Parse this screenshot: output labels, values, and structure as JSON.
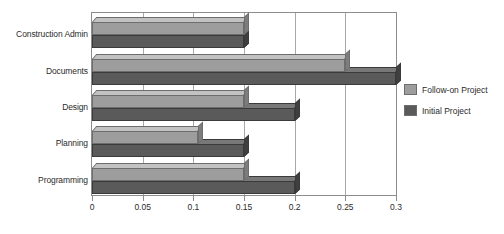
{
  "chart_data": {
    "type": "bar",
    "orientation": "horizontal",
    "title": "",
    "xlabel": "",
    "ylabel": "",
    "categories": [
      "Construction Admin",
      "Documents",
      "Design",
      "Planning",
      "Programming"
    ],
    "series": [
      {
        "name": "Follow-on Project",
        "color": "#9d9d9d",
        "values": [
          0.15,
          0.25,
          0.15,
          0.105,
          0.15
        ]
      },
      {
        "name": "Initial Project",
        "color": "#5a5a5a",
        "values": [
          0.15,
          0.3,
          0.2,
          0.15,
          0.2
        ]
      }
    ],
    "xlim": [
      0,
      0.3
    ],
    "xticks": [
      0,
      0.05,
      0.1,
      0.15,
      0.2,
      0.25,
      0.3
    ],
    "xtick_labels": [
      "0",
      "0.05",
      "0.1",
      "0.15",
      "0.2",
      "0.25",
      "0.3"
    ],
    "grid": true,
    "grid_axis": "x",
    "legend_position": "right",
    "style": "3d-bar"
  }
}
